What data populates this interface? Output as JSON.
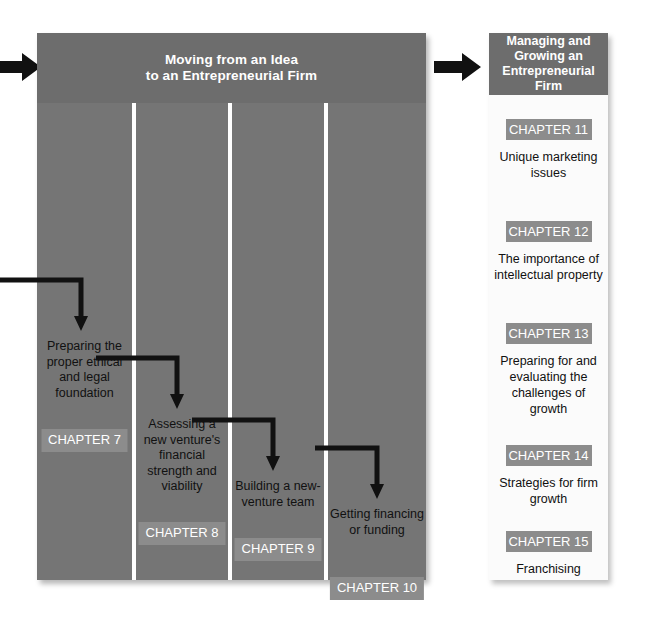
{
  "arrows": {
    "left_entry": "arrow-right",
    "between_panels": "arrow-right"
  },
  "left_panel": {
    "title_line1": "Moving from an Idea",
    "title_line2": "to an Entrepreneurial Firm",
    "columns": [
      {
        "description": "Preparing the proper ethical and legal foundation",
        "chapter": "CHAPTER 7"
      },
      {
        "description": "Assessing a new venture's financial strength and viability",
        "chapter": "CHAPTER 8"
      },
      {
        "description": "Building a new-venture team",
        "chapter": "CHAPTER 9"
      },
      {
        "description": "Getting financing or funding",
        "chapter": "CHAPTER 10"
      }
    ]
  },
  "right_panel": {
    "title_line1": "Managing and",
    "title_line2": "Growing an",
    "title_line3": "Entrepreneurial Firm",
    "items": [
      {
        "chapter": "CHAPTER 11",
        "description": "Unique marketing issues"
      },
      {
        "chapter": "CHAPTER 12",
        "description": "The importance of intellectual property"
      },
      {
        "chapter": "CHAPTER 13",
        "description": "Preparing for and evaluating the challenges of growth"
      },
      {
        "chapter": "CHAPTER 14",
        "description": "Strategies for firm growth"
      },
      {
        "chapter": "CHAPTER 15",
        "description": "Franchising"
      }
    ]
  },
  "colors": {
    "panel_body": "#757575",
    "panel_header": "#6d6d6d",
    "chapter_badge": "#8c8c8c",
    "right_panel_bg": "#fbfbfb",
    "arrow": "#111111",
    "divider": "#ffffff"
  }
}
